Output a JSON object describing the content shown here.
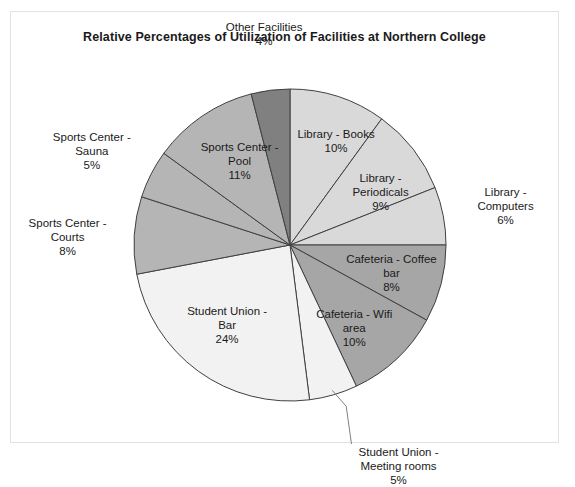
{
  "chart_data": {
    "type": "pie",
    "title": "Relative Percentages of Utilization of Facilities at Northern College",
    "xlabel": "",
    "ylabel": "",
    "legend": "none",
    "grid": false,
    "units": "percent",
    "total": 100,
    "categories": [
      "Library - Books",
      "Library - Periodicals",
      "Library - Computers",
      "Cafeteria - Coffee bar",
      "Cafeteria - Wifi area",
      "Student Union - Meeting rooms",
      "Student Union - Bar",
      "Sports Center - Courts",
      "Sports Center - Sauna",
      "Sports Center - Pool",
      "Other Facilities"
    ],
    "values": [
      10,
      9,
      6,
      8,
      10,
      5,
      24,
      8,
      5,
      11,
      4
    ],
    "slices": [
      {
        "label": "Library - Books",
        "value": 10,
        "value_text": "10%",
        "line1": "Library - Books",
        "line2": "10%",
        "color": "#d9d9d9",
        "label_placement": "inside",
        "start_angle_deg": 0,
        "end_angle_deg": 36
      },
      {
        "label": "Library - Periodicals",
        "value": 9,
        "value_text": "9%",
        "line1": "Library -",
        "line2": "Periodicals",
        "line3": "9%",
        "color": "#d9d9d9",
        "label_placement": "inside",
        "start_angle_deg": 36,
        "end_angle_deg": 68.4
      },
      {
        "label": "Library - Computers",
        "value": 6,
        "value_text": "6%",
        "line1": "Library -",
        "line2": "Computers",
        "line3": "6%",
        "color": "#d9d9d9",
        "label_placement": "outside",
        "start_angle_deg": 68.4,
        "end_angle_deg": 90
      },
      {
        "label": "Cafeteria - Coffee bar",
        "value": 8,
        "value_text": "8%",
        "line1": "Cafeteria - Coffee",
        "line2": "bar",
        "line3": "8%",
        "color": "#a6a6a6",
        "label_placement": "inside",
        "start_angle_deg": 90,
        "end_angle_deg": 118.8
      },
      {
        "label": "Cafeteria - Wifi area",
        "value": 10,
        "value_text": "10%",
        "line1": "Cafeteria - Wifi",
        "line2": "area",
        "line3": "10%",
        "color": "#a6a6a6",
        "label_placement": "inside",
        "start_angle_deg": 118.8,
        "end_angle_deg": 154.8
      },
      {
        "label": "Student Union - Meeting rooms",
        "value": 5,
        "value_text": "5%",
        "line1": "Student Union -",
        "line2": "Meeting rooms",
        "line3": "5%",
        "color": "#f2f2f2",
        "label_placement": "outside-leader",
        "start_angle_deg": 154.8,
        "end_angle_deg": 172.8
      },
      {
        "label": "Student Union - Bar",
        "value": 24,
        "value_text": "24%",
        "line1": "Student Union -",
        "line2": "Bar",
        "line3": "24%",
        "color": "#f2f2f2",
        "label_placement": "inside",
        "start_angle_deg": 172.8,
        "end_angle_deg": 259.2
      },
      {
        "label": "Sports Center - Courts",
        "value": 8,
        "value_text": "8%",
        "line1": "Sports Center -",
        "line2": "Courts",
        "line3": "8%",
        "color": "#b5b5b5",
        "label_placement": "outside",
        "start_angle_deg": 259.2,
        "end_angle_deg": 288
      },
      {
        "label": "Sports Center - Sauna",
        "value": 5,
        "value_text": "5%",
        "line1": "Sports Center -",
        "line2": "Sauna",
        "line3": "5%",
        "color": "#b5b5b5",
        "label_placement": "outside",
        "start_angle_deg": 288,
        "end_angle_deg": 306
      },
      {
        "label": "Sports Center - Pool",
        "value": 11,
        "value_text": "11%",
        "line1": "Sports Center -",
        "line2": "Pool",
        "line3": "11%",
        "color": "#b5b5b5",
        "label_placement": "inside",
        "start_angle_deg": 306,
        "end_angle_deg": 345.6
      },
      {
        "label": "Other Facilities",
        "value": 4,
        "value_text": "4%",
        "line1": "Other Facilities",
        "line2": "4%",
        "color": "#808080",
        "label_placement": "outside",
        "start_angle_deg": 345.6,
        "end_angle_deg": 360
      }
    ],
    "geometry": {
      "center_x": 290,
      "center_y": 245,
      "radius": 156
    },
    "style": {
      "slice_border_color": "#404040",
      "frame_border_color": "#e2e2e2",
      "background": "#ffffff",
      "text_color": "#1a1a1a"
    }
  }
}
